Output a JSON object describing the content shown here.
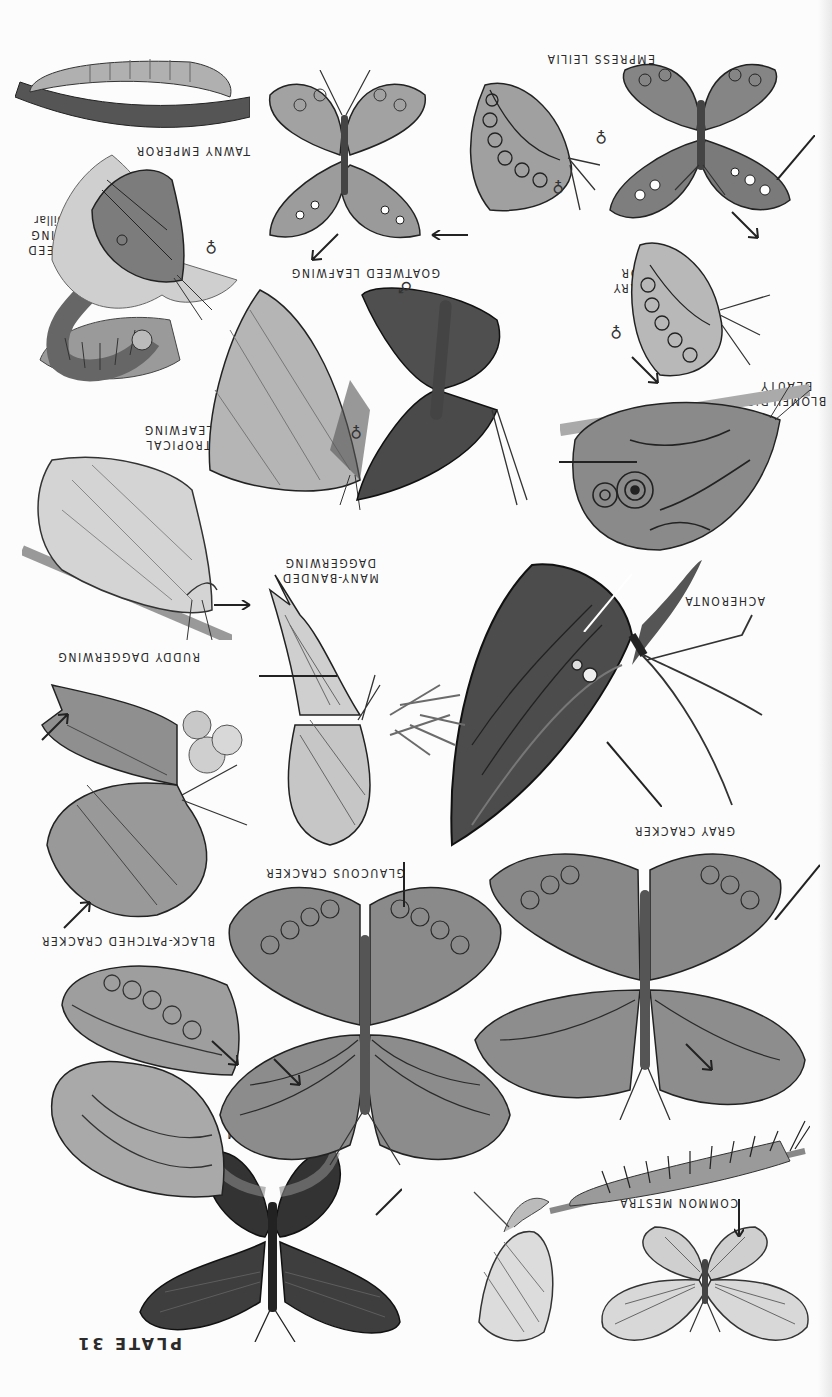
{
  "plate": {
    "title": "PLATE 31",
    "orientation": "rotated 180 degrees",
    "background": "#fcfcfc",
    "ink": "#2a2a2a"
  },
  "labels": {
    "common_mestra": "COMMON MESTRA",
    "red_rim": "RED RIM",
    "black_patched_cracker": "BLACK-PATCHED CRACKER",
    "glaucous_cracker": "GLAUCOUS CRACKER",
    "gray_cracker": "GRAY CRACKER",
    "acheronta": "ACHERONTA",
    "ruddy_daggerwing": "RUDDY DAGGERWING",
    "many_banded_daggerwing_1": "MANY-BANDED",
    "many_banded_daggerwing_2": "DAGGERWING",
    "tropical_leafwing_1": "TROPICAL",
    "tropical_leafwing_2": "LEAFWING",
    "blomfilds_beauty_1": "BLOMFILD'S",
    "blomfilds_beauty_2": "BEAUTY",
    "goatweed_leafwing": "GOATWEED LEAFWING",
    "goatweed_caterpillar_1": "GOATWEED",
    "goatweed_caterpillar_2": "LEAFWING",
    "goatweed_caterpillar_3": "caterpillar",
    "hackberry_emperor_1": "HACKBERRY",
    "hackberry_emperor_2": "EMPEROR",
    "tawny_emperor": "TAWNY EMPEROR",
    "empress_leilia": "EMPRESS LEILIA"
  },
  "symbols": {
    "male": "♂",
    "female": "♀"
  },
  "figures": [
    {
      "name": "common-mestra-upperside",
      "kind": "butterfly"
    },
    {
      "name": "common-mestra-underside",
      "kind": "butterfly"
    },
    {
      "name": "common-mestra-caterpillar",
      "kind": "caterpillar"
    },
    {
      "name": "red-rim",
      "kind": "butterfly"
    },
    {
      "name": "black-patched-cracker",
      "kind": "butterfly"
    },
    {
      "name": "glaucous-cracker",
      "kind": "butterfly"
    },
    {
      "name": "gray-cracker",
      "kind": "butterfly"
    },
    {
      "name": "acheronta",
      "kind": "butterfly"
    },
    {
      "name": "ruddy-daggerwing",
      "kind": "butterfly"
    },
    {
      "name": "many-banded-daggerwing",
      "kind": "butterfly"
    },
    {
      "name": "tropical-leafwing",
      "kind": "butterfly"
    },
    {
      "name": "blomfilds-beauty",
      "kind": "butterfly"
    },
    {
      "name": "goatweed-leafwing-male",
      "kind": "butterfly"
    },
    {
      "name": "goatweed-leafwing-female",
      "kind": "butterfly"
    },
    {
      "name": "goatweed-leafwing-caterpillar",
      "kind": "caterpillar"
    },
    {
      "name": "goatweed-leafwing-chrysalis",
      "kind": "caterpillar"
    },
    {
      "name": "hackberry-emperor",
      "kind": "butterfly"
    },
    {
      "name": "tawny-emperor",
      "kind": "butterfly"
    },
    {
      "name": "tawny-emperor-underside",
      "kind": "butterfly"
    },
    {
      "name": "empress-leilia-upperside",
      "kind": "butterfly"
    },
    {
      "name": "empress-leilia-underside",
      "kind": "butterfly"
    }
  ]
}
